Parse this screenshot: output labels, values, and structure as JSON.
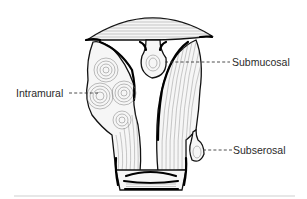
{
  "diagram": {
    "labels": [
      {
        "id": "intramural",
        "text": "Intramural"
      },
      {
        "id": "submucosal",
        "text": "Submucosal"
      },
      {
        "id": "subserosal",
        "text": "Subserosal"
      }
    ],
    "colors": {
      "background": "#ffffff",
      "ink": "#111111",
      "label_text": "#2a2a2a"
    }
  }
}
